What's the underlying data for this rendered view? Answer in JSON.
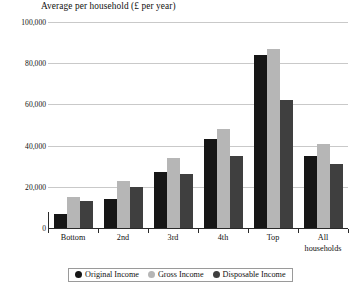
{
  "chart_data": {
    "type": "bar",
    "title": "Average per household (£ per year)",
    "xlabel": "",
    "ylabel": "",
    "ylim": [
      0,
      100000
    ],
    "grid": true,
    "legend_position": "bottom",
    "categories": [
      "Bottom",
      "2nd",
      "3rd",
      "4th",
      "Top",
      "All\nhouseholds"
    ],
    "category_labels": [
      {
        "line1": "Bottom",
        "line2": ""
      },
      {
        "line1": "2nd",
        "line2": ""
      },
      {
        "line1": "3rd",
        "line2": ""
      },
      {
        "line1": "4th",
        "line2": ""
      },
      {
        "line1": "Top",
        "line2": ""
      },
      {
        "line1": "All",
        "line2": "households"
      }
    ],
    "ytick_labels": [
      "100,000",
      "80,000",
      "60,000",
      "40,000",
      "20,000",
      "0"
    ],
    "ytick_values": [
      100000,
      80000,
      60000,
      40000,
      20000,
      0
    ],
    "series": [
      {
        "name": "Original Income",
        "color": "#161616",
        "values": [
          7000,
          14000,
          27000,
          43000,
          84000,
          35000
        ]
      },
      {
        "name": "Gross Income",
        "color": "#b6b6b6",
        "values": [
          15000,
          23000,
          34000,
          48000,
          87000,
          41000
        ]
      },
      {
        "name": "Disposable Income",
        "color": "#3f3f3f",
        "values": [
          13000,
          20000,
          26000,
          35000,
          62000,
          31000
        ]
      }
    ]
  },
  "legend": {
    "items": [
      {
        "label": "Original Income",
        "color": "#161616"
      },
      {
        "label": "Gross Income",
        "color": "#b6b6b6"
      },
      {
        "label": "Disposable Income",
        "color": "#3f3f3f"
      }
    ]
  }
}
